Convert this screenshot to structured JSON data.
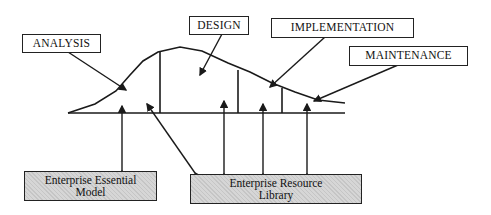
{
  "diagram": {
    "phases": [
      {
        "id": "analysis",
        "label": "ANALYSIS"
      },
      {
        "id": "design",
        "label": "DESIGN"
      },
      {
        "id": "implementation",
        "label": "IMPLEMENTATION"
      },
      {
        "id": "maintenance",
        "label": "MAINTENANCE"
      }
    ],
    "repositories": [
      {
        "id": "essential-model",
        "line1": "Enterprise Essential",
        "line2": "Model"
      },
      {
        "id": "resource-library",
        "line1": "Enterprise Resource",
        "line2": "Library"
      }
    ],
    "connections": [
      {
        "from": "analysis",
        "to": "essential-model"
      },
      {
        "from": "analysis",
        "to": "resource-library"
      },
      {
        "from": "design",
        "to": "resource-library"
      },
      {
        "from": "implementation",
        "to": "resource-library"
      },
      {
        "from": "maintenance",
        "to": "resource-library"
      }
    ],
    "colors": {
      "line": "#1a1a1a",
      "repository_fill": "#d6d6d6"
    }
  }
}
